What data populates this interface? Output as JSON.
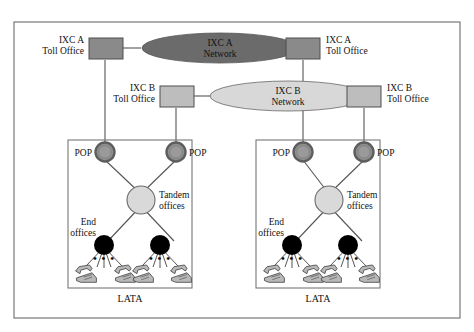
{
  "figure": {
    "type": "telecom-network-diagram",
    "outer_frame": true
  },
  "backbone": {
    "carriers": [
      {
        "id": "ixc-a",
        "network_label_line1": "IXC  A",
        "network_label_line2": "Network",
        "network_fill": "#6b6b6b",
        "left_toll_office": {
          "label_line1": "IXC  A",
          "label_line2": "Toll Office",
          "fill": "#8a8a8a"
        },
        "right_toll_office": {
          "label_line1": "IXC  A",
          "label_line2": "Toll Office",
          "fill": "#8a8a8a"
        }
      },
      {
        "id": "ixc-b",
        "network_label_line1": "IXC  B",
        "network_label_line2": "Network",
        "network_fill": "#d8d8d8",
        "left_toll_office": {
          "label_line1": "IXC  B",
          "label_line2": "Toll Office",
          "fill": "#bdbdbd"
        },
        "right_toll_office": {
          "label_line1": "IXC  B",
          "label_line2": "Toll Office",
          "fill": "#bdbdbd"
        }
      }
    ]
  },
  "latas": [
    {
      "id": "lata-left",
      "caption": "LATA",
      "pop_left_label": "POP",
      "pop_right_label": "POP",
      "tandem_label_line1": "Tandem",
      "tandem_label_line2": "offices",
      "end_office_label_line1": "End",
      "end_office_label_line2": "offices",
      "phone_group_left_ellipsis": "• • •",
      "phone_group_right_ellipsis": "• • •"
    },
    {
      "id": "lata-right",
      "caption": "LATA",
      "pop_left_label": "POP",
      "pop_right_label": "POP",
      "tandem_label_line1": "Tandem",
      "tandem_label_line2": "offices",
      "end_office_label_line1": "End",
      "end_office_label_line2": "offices",
      "phone_group_left_ellipsis": "• • •",
      "phone_group_right_ellipsis": "• • •"
    }
  ],
  "colors": {
    "pop_fill": "#8f8f8f",
    "pop_ring": "#6e6e6e",
    "tandem_fill": "#d9d9d9",
    "tandem_stroke": "#6b6b6b",
    "end_office_fill": "#000000",
    "line": "#555555",
    "frame": "#777777",
    "lata_box": "#777777",
    "phone_body": "#b9b9b9",
    "phone_outline": "#4a4a4a"
  }
}
